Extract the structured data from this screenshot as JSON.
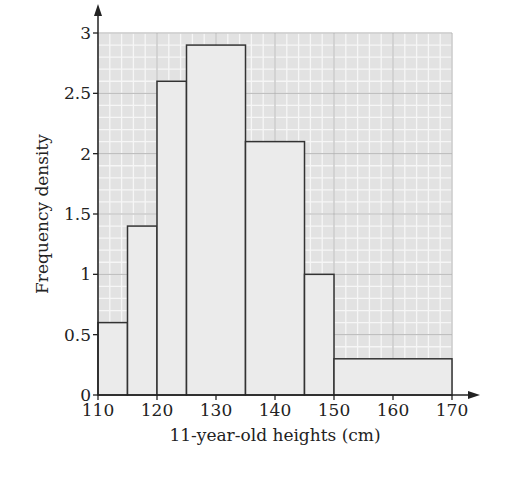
{
  "chart_data": {
    "type": "bar",
    "subtype": "histogram",
    "title": "",
    "xlabel": "11-year-old heights (cm)",
    "ylabel": "Frequency density",
    "xlim": [
      110,
      170
    ],
    "ylim": [
      0,
      3
    ],
    "x_ticks": [
      110,
      120,
      130,
      140,
      150,
      160,
      170
    ],
    "y_ticks": [
      0,
      0.5,
      1,
      1.5,
      2,
      2.5,
      3
    ],
    "x_tick_labels": [
      "110",
      "120",
      "130",
      "140",
      "150",
      "160",
      "170"
    ],
    "y_tick_labels": [
      "0",
      "0.5",
      "1",
      "1.5",
      "2",
      "2.5",
      "3"
    ],
    "grid": true,
    "legend": null,
    "bins": [
      {
        "from": 110,
        "to": 115,
        "frequency_density": 0.6
      },
      {
        "from": 115,
        "to": 120,
        "frequency_density": 1.4
      },
      {
        "from": 120,
        "to": 125,
        "frequency_density": 2.6
      },
      {
        "from": 125,
        "to": 135,
        "frequency_density": 2.9
      },
      {
        "from": 135,
        "to": 145,
        "frequency_density": 2.1
      },
      {
        "from": 145,
        "to": 150,
        "frequency_density": 1.0
      },
      {
        "from": 150,
        "to": 170,
        "frequency_density": 0.3
      }
    ],
    "categories": [
      "110-115",
      "115-120",
      "120-125",
      "125-135",
      "135-145",
      "145-150",
      "150-170"
    ],
    "values": [
      0.6,
      1.4,
      2.6,
      2.9,
      2.1,
      1.0,
      0.3
    ],
    "colors": {
      "bar_fill": "#ebebeb",
      "bar_stroke": "#333333",
      "grid_bg": "#e2e2e2",
      "grid_minor": "#f6f6f6",
      "grid_major": "#b5b5b5",
      "axis": "#222222"
    }
  }
}
